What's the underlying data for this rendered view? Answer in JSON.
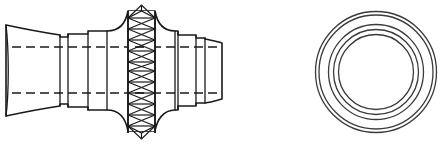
{
  "drawing": {
    "title": "Flexible bellows pipe coupling — side elevation and end view",
    "background_color": "#ffffff",
    "line_color": "#1a1a1a",
    "ring_color": "#3a3a3a",
    "canvas": {
      "width": 444,
      "height": 145
    },
    "views": [
      {
        "name": "side-elevation",
        "label": "Side elevation",
        "centerline_y": 70,
        "x_range": [
          4,
          222
        ]
      },
      {
        "name": "end-view",
        "label": "End view",
        "center": {
          "x": 376,
          "y": 72
        },
        "ring_radii": [
          60.5,
          57,
          47.5,
          42.5,
          37.5
        ]
      }
    ],
    "side_profile": {
      "left_flare": {
        "name": "left-flared-end",
        "x_start": 5,
        "x_end": 60,
        "half_height_outer": 46,
        "half_height_inner": 34
      },
      "left_step_1": {
        "name": "left-step-collar",
        "x_start": 60,
        "x_end": 68,
        "half_height": 34
      },
      "left_step_2": {
        "name": "left-sleeve-a",
        "x_start": 68,
        "x_end": 88,
        "half_height": 33
      },
      "left_step_3": {
        "name": "left-sleeve-b",
        "x_start": 88,
        "x_end": 107,
        "half_height": 37
      },
      "bulge": {
        "name": "central-bulge",
        "x_start": 107,
        "x_end": 158,
        "half_height": 56
      },
      "right_step_3": {
        "name": "right-sleeve-b",
        "x_start": 158,
        "x_end": 178,
        "half_height": 37
      },
      "right_step_2": {
        "name": "right-sleeve-a",
        "x_start": 178,
        "x_end": 196,
        "half_height": 33
      },
      "right_step_1": {
        "name": "right-step-collar",
        "x_start": 196,
        "x_end": 205,
        "half_height": 34
      },
      "right_flare": {
        "name": "right-flared-end",
        "x_start": 205,
        "x_end": 222,
        "half_height": 30
      }
    },
    "hidden_lines": {
      "name": "bore-hidden-lines",
      "upper_y": 47,
      "lower_y": 93,
      "x_start": 10,
      "x_end": 222,
      "dash_pattern": "9 5"
    },
    "bellows": {
      "name": "corrugated-bellows-section",
      "x_left_rail": 128,
      "x_right_rail": 155,
      "y_top": 8,
      "y_bottom": 133,
      "cell_count": 11,
      "pattern": "stacked-bowtie-lattice",
      "cap_top": "peaked",
      "cap_bottom": "peaked"
    }
  }
}
